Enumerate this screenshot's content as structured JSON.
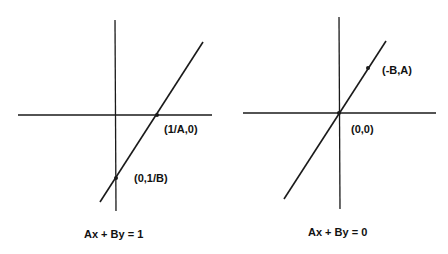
{
  "diagrams": [
    {
      "equation": "Ax + By = 1",
      "points": [
        {
          "label": "(1/A,0)"
        },
        {
          "label": "(0,1/B)"
        }
      ]
    },
    {
      "equation": "Ax + By = 0",
      "points": [
        {
          "label": "(-B,A)"
        },
        {
          "label": "(0,0)"
        }
      ]
    }
  ],
  "colors": {
    "line": "#1a1a1a",
    "background": "#ffffff"
  }
}
